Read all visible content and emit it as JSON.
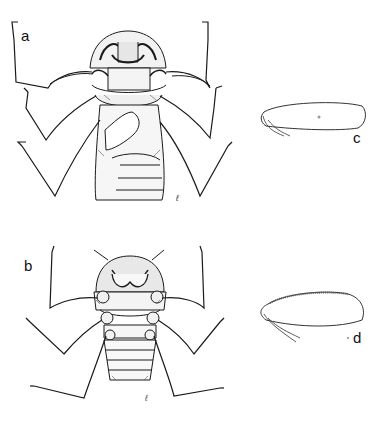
{
  "figure": {
    "panels": [
      {
        "id": "a",
        "label": "a",
        "subject": "insect ventral view, whole body"
      },
      {
        "id": "b",
        "label": "b",
        "subject": "insect ventral view, whole body"
      },
      {
        "id": "c",
        "label": "c",
        "subject": "hemelytron / appendage outline"
      },
      {
        "id": "d",
        "label": "d",
        "subject": "hemelytron / appendage outline with serrate margin"
      }
    ],
    "ink_color": "#1a1a1a",
    "background": "#ffffff"
  }
}
